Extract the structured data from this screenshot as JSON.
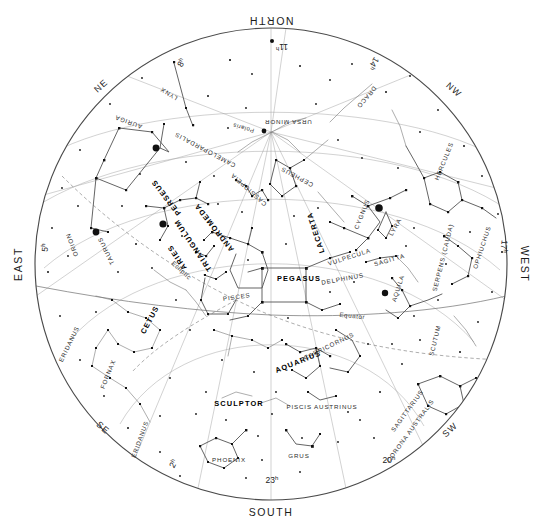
{
  "chart": {
    "type": "sky-map",
    "projection": "all-sky circular horizon map",
    "background_color": "#ffffff",
    "ink_color": "#1a1a1a",
    "center_label": "zenith",
    "cardinals": [
      {
        "id": "north",
        "label": "NORTH",
        "x": 271,
        "y": 17,
        "rotation": 180
      },
      {
        "id": "south",
        "label": "SOUTH",
        "x": 271,
        "y": 512,
        "rotation": 0
      },
      {
        "id": "east",
        "label": "EAST",
        "x": 22,
        "y": 264,
        "rotation": -90
      },
      {
        "id": "west",
        "label": "WEST",
        "x": 521,
        "y": 264,
        "rotation": 90
      }
    ],
    "intercardinals": [
      {
        "id": "ne",
        "label": "NE",
        "x": 103,
        "y": 88,
        "rotation": -42
      },
      {
        "id": "nw",
        "label": "NW",
        "x": 452,
        "y": 92,
        "rotation": 42
      },
      {
        "id": "se",
        "label": "SE",
        "x": 101,
        "y": 430,
        "rotation": 42
      },
      {
        "id": "sw",
        "label": "SW",
        "x": 452,
        "y": 432,
        "rotation": -42
      }
    ],
    "hour_markers": [
      {
        "id": "h02",
        "value": "2",
        "unit": "h",
        "x": 176,
        "y": 465,
        "rotation": -62
      },
      {
        "id": "h05",
        "value": "5",
        "unit": "h",
        "x": 48,
        "y": 248,
        "rotation": -84
      },
      {
        "id": "h08",
        "value": "8",
        "unit": "h",
        "x": 184,
        "y": 64,
        "rotation": -62
      },
      {
        "id": "h11",
        "value": "11",
        "unit": "h",
        "x": 282,
        "y": 44,
        "rotation": 180
      },
      {
        "id": "h14",
        "value": "14",
        "unit": "h",
        "x": 371,
        "y": 62,
        "rotation": 122
      },
      {
        "id": "h17",
        "value": "17",
        "unit": "h",
        "x": 501,
        "y": 246,
        "rotation": 96
      },
      {
        "id": "h20",
        "value": "20",
        "unit": "h",
        "x": 389,
        "y": 463,
        "rotation": 0
      },
      {
        "id": "h23",
        "value": "23",
        "unit": "h",
        "x": 272,
        "y": 483,
        "rotation": 0
      }
    ],
    "reference_lines": [
      {
        "id": "equator",
        "label": "Equator",
        "style": "solid",
        "label_x": 352,
        "label_y": 318,
        "label_rot": 6
      },
      {
        "id": "ecliptic",
        "label": "Ecliptic",
        "style": "dashed",
        "label_x": 180,
        "label_y": 272,
        "label_rot": 42
      }
    ],
    "named_stars": [
      {
        "id": "polaris",
        "label": "Polaris",
        "x": 262,
        "y": 132,
        "rotation": 196,
        "magnitude": "bright"
      }
    ],
    "constellations": [
      {
        "id": "ursa-minor",
        "label": "URSA MINOR",
        "x": 288,
        "y": 120,
        "rotation": 180,
        "emphasis": "minor"
      },
      {
        "id": "draco",
        "label": "DRACO",
        "x": 365,
        "y": 96,
        "rotation": 130,
        "emphasis": "minor"
      },
      {
        "id": "cepheus",
        "label": "CEPHEUS",
        "x": 298,
        "y": 175,
        "rotation": 208,
        "emphasis": "minor"
      },
      {
        "id": "cassiopeia",
        "label": "CASSIOPEIA",
        "x": 250,
        "y": 188,
        "rotation": 222,
        "emphasis": "minor"
      },
      {
        "id": "camelopardalis",
        "label": "CAMELOPARDALIS",
        "x": 206,
        "y": 148,
        "rotation": 208,
        "emphasis": "minor"
      },
      {
        "id": "lynx",
        "label": "LYNX",
        "x": 170,
        "y": 92,
        "rotation": 212,
        "emphasis": "minor"
      },
      {
        "id": "auriga",
        "label": "AURIGA",
        "x": 129,
        "y": 120,
        "rotation": 200,
        "emphasis": "minor"
      },
      {
        "id": "perseus",
        "label": "PERSEUS",
        "x": 168,
        "y": 196,
        "rotation": 232,
        "emphasis": "major"
      },
      {
        "id": "andromeda",
        "label": "ANDROMEDA",
        "x": 216,
        "y": 226,
        "rotation": 232,
        "emphasis": "major"
      },
      {
        "id": "triangulum",
        "label": "TRIANGULUM",
        "x": 195,
        "y": 244,
        "rotation": 236,
        "emphasis": "major"
      },
      {
        "id": "aries",
        "label": "ARIES",
        "x": 179,
        "y": 256,
        "rotation": 236,
        "emphasis": "major"
      },
      {
        "id": "taurus",
        "label": "TAURUS",
        "x": 108,
        "y": 250,
        "rotation": 244,
        "emphasis": "minor"
      },
      {
        "id": "orion",
        "label": "ORION",
        "x": 74,
        "y": 244,
        "rotation": 250,
        "emphasis": "minor"
      },
      {
        "id": "eridanus-1",
        "label": "ERIDANUS",
        "x": 71,
        "y": 345,
        "rotation": 296,
        "emphasis": "minor"
      },
      {
        "id": "eridanus-2",
        "label": "ERIDANUS",
        "x": 142,
        "y": 440,
        "rotation": 290,
        "emphasis": "minor"
      },
      {
        "id": "fornax",
        "label": "FORNAX",
        "x": 110,
        "y": 375,
        "rotation": 292,
        "emphasis": "minor"
      },
      {
        "id": "cetus",
        "label": "CETUS",
        "x": 152,
        "y": 321,
        "rotation": 298,
        "emphasis": "major"
      },
      {
        "id": "pisces",
        "label": "PISCES",
        "x": 237,
        "y": 299,
        "rotation": 352,
        "emphasis": "minor"
      },
      {
        "id": "pegasus",
        "label": "PEGASUS",
        "x": 299,
        "y": 281,
        "rotation": 0,
        "emphasis": "major"
      },
      {
        "id": "lacerta",
        "label": "LACERTA",
        "x": 318,
        "y": 232,
        "rotation": 252,
        "emphasis": "major"
      },
      {
        "id": "cygnus",
        "label": "CYGNUS",
        "x": 364,
        "y": 215,
        "rotation": 292,
        "emphasis": "minor"
      },
      {
        "id": "lyra",
        "label": "LYRA",
        "x": 397,
        "y": 228,
        "rotation": 300,
        "emphasis": "minor"
      },
      {
        "id": "vulpecula",
        "label": "VULPECULA",
        "x": 350,
        "y": 259,
        "rotation": 342,
        "emphasis": "minor"
      },
      {
        "id": "delphinus",
        "label": "DELPHINUS",
        "x": 343,
        "y": 281,
        "rotation": 350,
        "emphasis": "minor"
      },
      {
        "id": "sagitta",
        "label": "SAGITTA",
        "x": 390,
        "y": 262,
        "rotation": 344,
        "emphasis": "minor"
      },
      {
        "id": "aquila",
        "label": "AQUILA",
        "x": 400,
        "y": 289,
        "rotation": 288,
        "emphasis": "minor"
      },
      {
        "id": "hercules",
        "label": "HERCULES",
        "x": 446,
        "y": 162,
        "rotation": 292,
        "emphasis": "minor"
      },
      {
        "id": "serpens-cauda",
        "label": "SERPENS (CAUDA)",
        "x": 445,
        "y": 258,
        "rotation": 284,
        "emphasis": "minor"
      },
      {
        "id": "ophiuchus",
        "label": "OPHIUCHUS",
        "x": 484,
        "y": 248,
        "rotation": 288,
        "emphasis": "minor"
      },
      {
        "id": "scutum",
        "label": "SCUTUM",
        "x": 437,
        "y": 341,
        "rotation": 284,
        "emphasis": "minor"
      },
      {
        "id": "capricornus",
        "label": "CAPRICORNUS",
        "x": 330,
        "y": 348,
        "rotation": 334,
        "emphasis": "minor"
      },
      {
        "id": "aquarius",
        "label": "AQUARIUS",
        "x": 299,
        "y": 364,
        "rotation": 338,
        "emphasis": "major"
      },
      {
        "id": "piscis-austrinus",
        "label": "PISCIS AUSTRINUS",
        "x": 322,
        "y": 409,
        "rotation": 0,
        "emphasis": "minor"
      },
      {
        "id": "sculptor",
        "label": "SCULPTOR",
        "x": 239,
        "y": 406,
        "rotation": 0,
        "emphasis": "major"
      },
      {
        "id": "phoenix",
        "label": "PHOENIX",
        "x": 229,
        "y": 462,
        "rotation": 0,
        "emphasis": "minor"
      },
      {
        "id": "grus",
        "label": "GRUS",
        "x": 299,
        "y": 458,
        "rotation": 0,
        "emphasis": "minor"
      },
      {
        "id": "sagittarius",
        "label": "SAGITTARIUS",
        "x": 409,
        "y": 412,
        "rotation": 306,
        "emphasis": "minor"
      },
      {
        "id": "corona-australis",
        "label": "CORONA AUSTRALIS",
        "x": 412,
        "y": 432,
        "rotation": 306,
        "emphasis": "minor"
      }
    ],
    "legend_note": ""
  }
}
